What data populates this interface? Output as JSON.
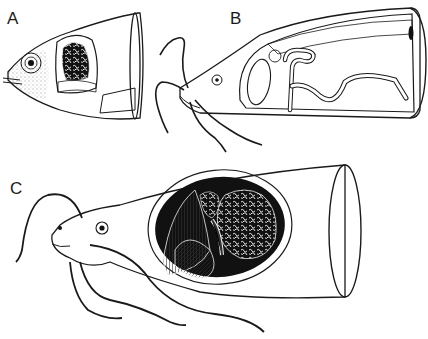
{
  "figure": {
    "panels": [
      {
        "id": "A",
        "label": "A",
        "description": "fish head with cutaway showing gill chamber"
      },
      {
        "id": "B",
        "label": "B",
        "description": "barbeled fish head with cutaway showing elongated respiratory sac"
      },
      {
        "id": "C",
        "label": "C",
        "description": "catfish head with cutaway showing arborescent suprabranchial organ"
      }
    ]
  },
  "colors": {
    "ink": "#1a1a1a",
    "paper": "#ffffff",
    "cavity": "#111111"
  }
}
